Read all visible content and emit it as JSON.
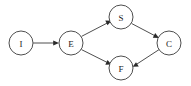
{
  "diagram": {
    "background_color": "#ffffff",
    "node_stroke_color": "#3a3a3a",
    "node_fill_color": "#ffffff",
    "label_color": "#1a1a1a",
    "edge_color": "#3a3a3a",
    "arrowhead_color": "#2a2a2a",
    "node_radius": 12,
    "nodes": [
      {
        "id": "I",
        "label": "I",
        "cx": 21,
        "cy": 43
      },
      {
        "id": "E",
        "label": "E",
        "cx": 71,
        "cy": 43
      },
      {
        "id": "S",
        "label": "S",
        "cx": 121,
        "cy": 17
      },
      {
        "id": "F",
        "label": "F",
        "cx": 121,
        "cy": 68
      },
      {
        "id": "C",
        "label": "C",
        "cx": 169,
        "cy": 43
      }
    ],
    "edges": [
      {
        "from": "I",
        "to": "E",
        "directed": true
      },
      {
        "from": "E",
        "to": "S",
        "directed": true
      },
      {
        "from": "E",
        "to": "F",
        "directed": true
      },
      {
        "from": "S",
        "to": "C",
        "directed": true
      },
      {
        "from": "C",
        "to": "F",
        "directed": true
      }
    ]
  }
}
